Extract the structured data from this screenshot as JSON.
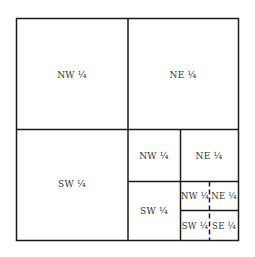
{
  "diagram": {
    "type": "land-survey-section-subdivision",
    "colors": {
      "line": "#1a1a1a",
      "text": "#333333",
      "background": "#ffffff"
    },
    "quarters": {
      "nw": {
        "label": "NW ¼"
      },
      "ne": {
        "label": "NE ¼"
      },
      "sw": {
        "label": "SW ¼"
      },
      "se": {
        "subdivided": true,
        "nw": {
          "label": "NW ¼"
        },
        "ne": {
          "label": "NE ¼"
        },
        "sw": {
          "label": "SW ¼"
        },
        "se": {
          "subdivided": true,
          "nw": {
            "label": "NW ¼"
          },
          "ne": {
            "label": "NE ¼"
          },
          "sw": {
            "label": "SW ¼"
          },
          "se": {
            "label": "SE ¼"
          }
        }
      }
    }
  }
}
